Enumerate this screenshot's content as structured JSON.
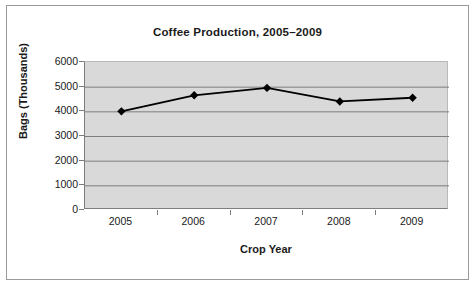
{
  "chart_data": {
    "type": "line",
    "title": "Coffee Production, 2005–2009",
    "xlabel": "Crop Year",
    "ylabel": "Bags (Thousands)",
    "categories": [
      "2005",
      "2006",
      "2007",
      "2008",
      "2009"
    ],
    "values": [
      4000,
      4650,
      4950,
      4400,
      4550
    ],
    "series": [
      {
        "name": "Coffee Production",
        "values": [
          4000,
          4650,
          4950,
          4400,
          4550
        ]
      }
    ],
    "ylim": [
      0,
      6000
    ],
    "yticks": [
      0,
      1000,
      2000,
      3000,
      4000,
      5000,
      6000
    ],
    "ytick_labels": [
      "0",
      "1000",
      "2000",
      "3000",
      "4000",
      "5000",
      "6000"
    ],
    "grid": "horizontal",
    "legend": "none",
    "marker": "diamond",
    "line_color": "#000000",
    "marker_color": "#000000",
    "plot_background": "#d9d9d9",
    "gridline_color": "#7d7d7d",
    "figure_background": "#ffffff",
    "border_color": "#9a9a9a"
  }
}
